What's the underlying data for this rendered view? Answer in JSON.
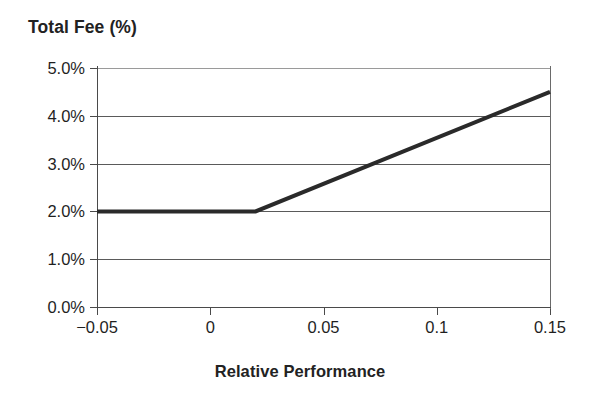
{
  "chart_data": {
    "type": "line",
    "title": "",
    "ylabel": "Total Fee (%)",
    "xlabel": "Relative Performance",
    "xlim": [
      -0.05,
      0.15
    ],
    "ylim": [
      0.0,
      5.0
    ],
    "grid": true,
    "legend": "none",
    "xticks": [
      -0.05,
      0,
      0.05,
      0.1,
      0.15
    ],
    "xtick_labels": [
      "−0.05",
      "0",
      "0.05",
      "0.1",
      "0.15"
    ],
    "yticks": [
      0.0,
      1.0,
      2.0,
      3.0,
      4.0,
      5.0
    ],
    "ytick_labels": [
      "0.0%",
      "1.0%",
      "2.0%",
      "3.0%",
      "4.0%",
      "5.0%"
    ],
    "series": [
      {
        "name": "Total Fee",
        "color": "#2a2a2a",
        "linewidth": 4,
        "x": [
          -0.05,
          0.02,
          0.15
        ],
        "values": [
          2.0,
          2.0,
          4.5
        ]
      }
    ],
    "annotations": []
  },
  "axes": {
    "y_title": "Total Fee (%)",
    "x_title": "Relative Performance",
    "ytick_labels": [
      "5.0%",
      "4.0%",
      "3.0%",
      "2.0%",
      "1.0%",
      "0.0%"
    ],
    "xtick_labels": [
      "−0.05",
      "0",
      "0.05",
      "0.1",
      "0.15"
    ]
  },
  "colors": {
    "line": "#2a2a2a",
    "grid": "#5a5a5a",
    "grid_faint": "#9a9a9a",
    "axis": "#4a4a4a",
    "text": "#1f1f1f",
    "background": "#ffffff"
  }
}
